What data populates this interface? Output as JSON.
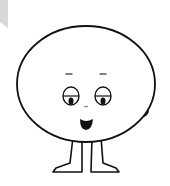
{
  "image": {
    "subject": "cartoon round-headed character",
    "alt": "Cartoon character with a large round head, sleepy eyes, small nose, open smiling mouth, two small ears and thin legs with feet",
    "colors": {
      "background": "#ffffff",
      "outline": "#111111",
      "fill": "#ffffff",
      "pupil": "#111111",
      "mouth": "#111111",
      "corner_shape": "#d6d6d6"
    }
  }
}
